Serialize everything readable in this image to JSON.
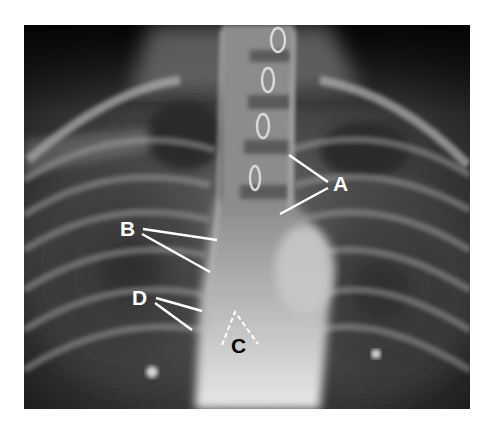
{
  "figure": {
    "type": "chest radiograph (PA view), labeled",
    "labels": [
      {
        "id": "A",
        "text": "A",
        "color": "#ffffff",
        "x": 333,
        "y": 191,
        "pointers": [
          [
            289,
            155
          ],
          [
            328,
            182
          ],
          [
            280,
            214
          ],
          [
            328,
            188
          ]
        ]
      },
      {
        "id": "B",
        "text": "B",
        "color": "#ffffff",
        "x": 120,
        "y": 236,
        "pointers": [
          [
            143,
            229
          ],
          [
            217,
            240
          ],
          [
            142,
            234
          ],
          [
            210,
            272
          ]
        ]
      },
      {
        "id": "C",
        "text": "C",
        "color": "#000000",
        "x": 231,
        "y": 353,
        "pointers": []
      },
      {
        "id": "D",
        "text": "D",
        "color": "#ffffff",
        "x": 132,
        "y": 305,
        "pointers": [
          [
            156,
            298
          ],
          [
            202,
            311
          ],
          [
            155,
            303
          ],
          [
            192,
            330
          ]
        ]
      }
    ],
    "c_marker": {
      "style": "dashed-chevron",
      "color": "#ffffff",
      "apex": [
        235,
        312
      ],
      "left": [
        222,
        345
      ],
      "right": [
        258,
        344
      ]
    }
  }
}
